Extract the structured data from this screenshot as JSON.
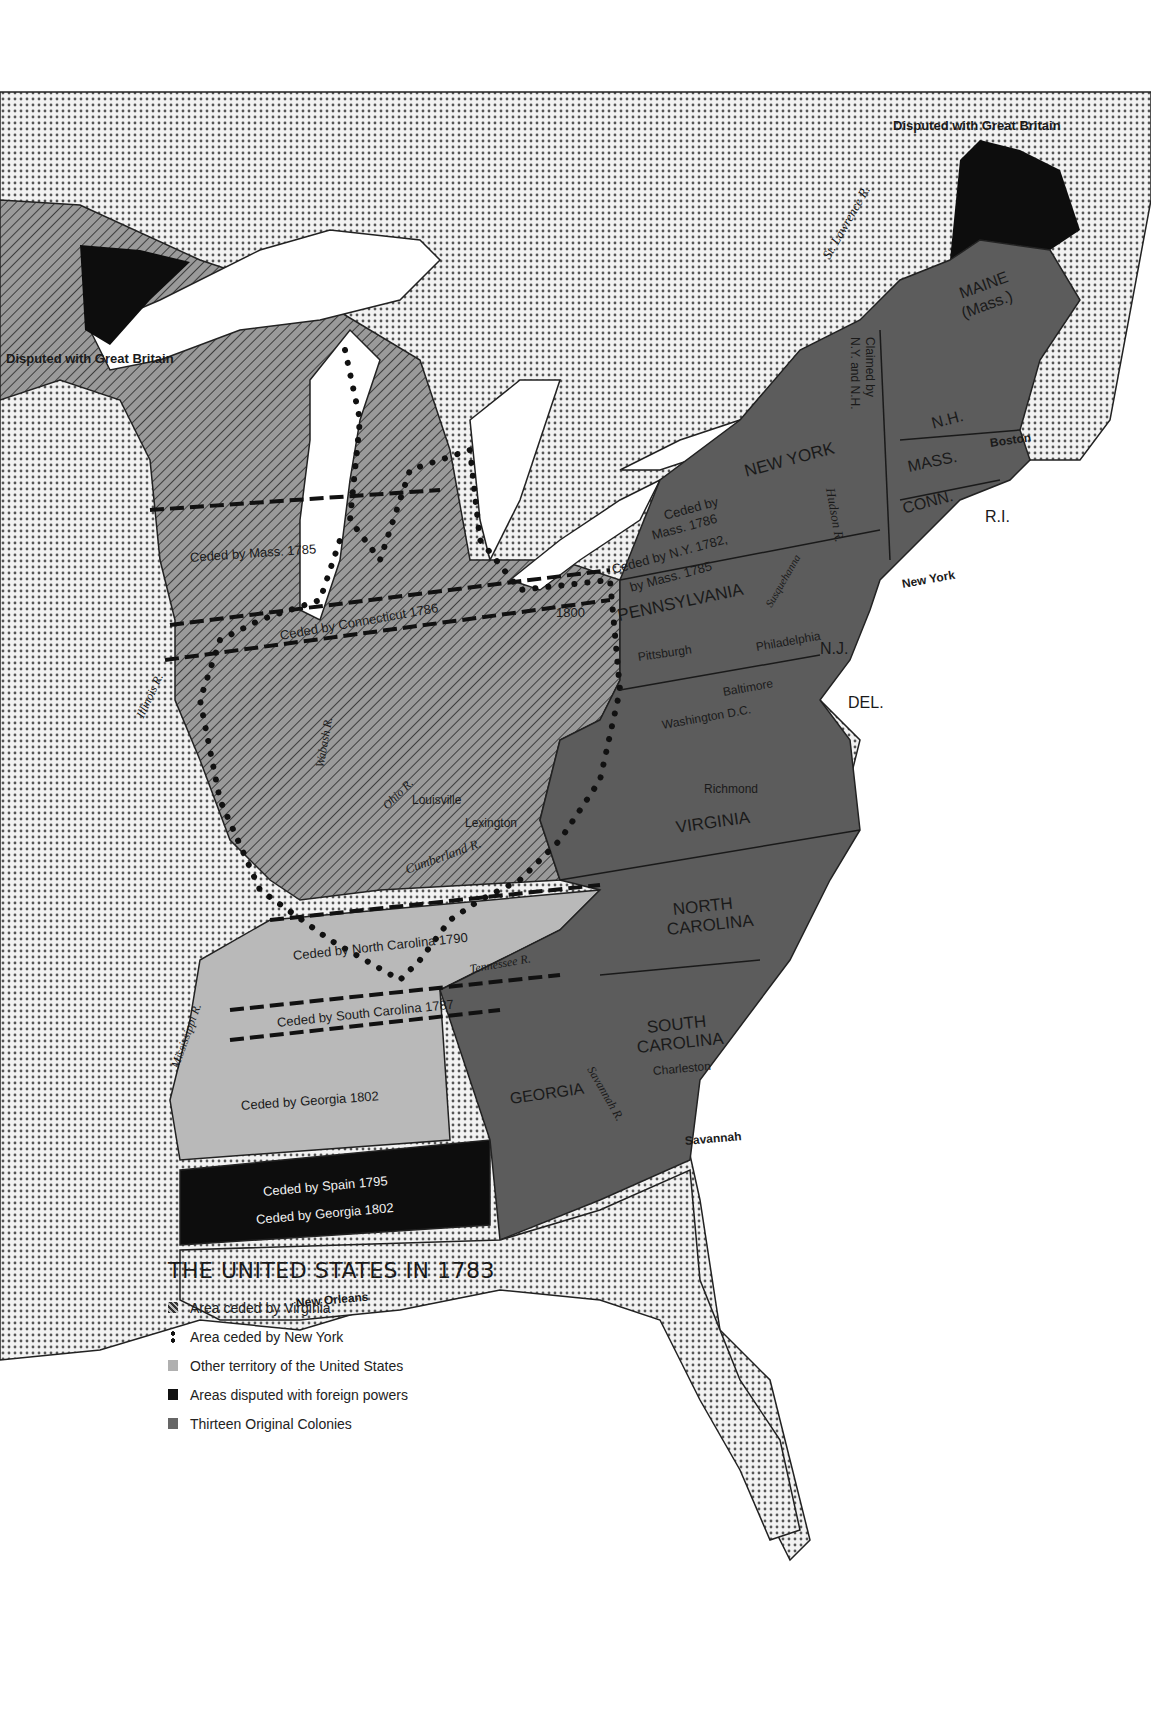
{
  "map": {
    "title": "THE UNITED STATES IN 1783",
    "colors": {
      "colonies": "#5c5c5c",
      "other_territory": "#b9b9b9",
      "disputed": "#0d0d0d",
      "foreign_dotted": "#e6e6e6",
      "water": "#ffffff",
      "hatch_base": "#8e8e8e"
    },
    "legend": [
      {
        "label": "Area ceded by Virginia",
        "symbol": "hatch-icon",
        "color": "#555555"
      },
      {
        "label": "Area ceded by New York",
        "symbol": "dots-icon",
        "color": "#111111"
      },
      {
        "label": "Other territory of the United States",
        "symbol": "square-icon",
        "color": "#b0b0b0"
      },
      {
        "label": "Areas disputed with foreign powers",
        "symbol": "square-icon",
        "color": "#111111"
      },
      {
        "label": "Thirteen Original Colonies",
        "symbol": "square-icon",
        "color": "#666666"
      }
    ],
    "labels": {
      "disputed_ne": "Disputed with Great Britain",
      "disputed_nw": "Disputed with Great Britain",
      "st_lawrence": "St. Lawrence R.",
      "maine": "MAINE",
      "maine_sub": "(Mass.)",
      "claimed_1": "Claimed by",
      "claimed_2": "N.Y. and N.H.",
      "nh": "N.H.",
      "mass": "MASS.",
      "conn": "CONN.",
      "ri": "R.I.",
      "boston": "Boston",
      "new_york_state": "NEW YORK",
      "new_york_city": "New York",
      "hudson": "Hudson R.",
      "ceded_mass_1786_a": "Ceded by",
      "ceded_mass_1786_b": "Mass. 1786",
      "ceded_ny_1782_a": "Ceded by N.Y. 1782,",
      "ceded_ny_1782_b": "by Mass. 1785",
      "pennsylvania": "PENNSYLVANIA",
      "susquehanna": "Susquehanna",
      "pittsburgh": "Pittsburgh",
      "philadelphia": "Philadelphia",
      "nj": "N.J.",
      "del": "DEL.",
      "baltimore": "Baltimore",
      "washington": "Washington D.C.",
      "richmond": "Richmond",
      "virginia": "VIRGINIA",
      "north_carolina_1": "NORTH",
      "north_carolina_2": "CAROLINA",
      "south_carolina_1": "SOUTH",
      "south_carolina_2": "CAROLINA",
      "charleston": "Charleston",
      "georgia": "GEORGIA",
      "savannah_r": "Savannah R.",
      "savannah": "Savannah",
      "ceded_mass_1785": "Ceded by Mass. 1785",
      "ceded_conn_1786": "Ceded by Connecticut 1786",
      "year_1800": "1800",
      "illinois": "Illinois R.",
      "wabash": "Wabash R.",
      "ohio": "Ohio R.",
      "louisville": "Louisville",
      "lexington": "Lexington",
      "cumberland": "Cumberland R.",
      "ceded_nc_1790": "Ceded by North Carolina 1790",
      "tennessee": "Tennessee R.",
      "ceded_sc_1787": "Ceded by South Carolina 1787",
      "mississippi": "Mississippi R.",
      "ceded_ga_1802": "Ceded by Georgia 1802",
      "ceded_spain_1795": "Ceded by Spain 1795",
      "ceded_ga_1802_b": "Ceded by Georgia 1802",
      "new_orleans": "New Orleans"
    }
  }
}
